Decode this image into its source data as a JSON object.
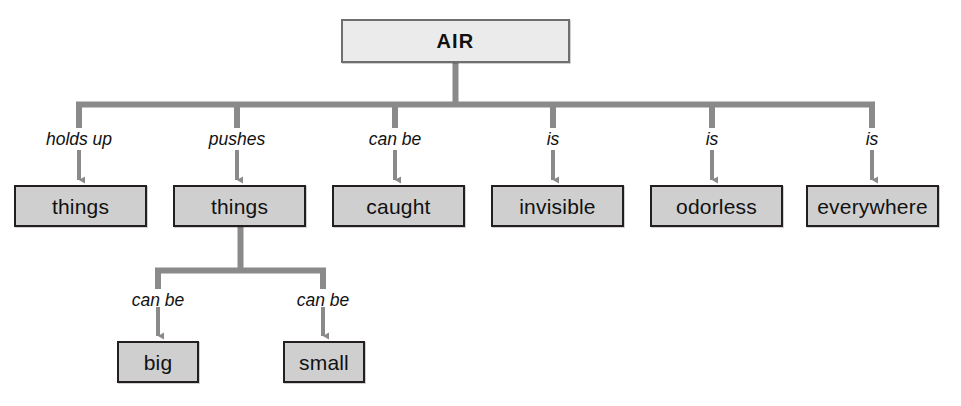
{
  "diagram": {
    "type": "tree-concept-map",
    "colors": {
      "background": "#ffffff",
      "node_fill": "#cfcfcf",
      "root_fill": "#ebebeb",
      "node_border": "#231f20",
      "root_border": "#6f6f6f",
      "connector": "#8a8a8a",
      "text": "#111111"
    },
    "root": {
      "label": "AIR"
    },
    "branches": [
      {
        "edge_label": "holds up",
        "node_label": "things"
      },
      {
        "edge_label": "pushes",
        "node_label": "things"
      },
      {
        "edge_label": "can be",
        "node_label": "caught"
      },
      {
        "edge_label": "is",
        "node_label": "invisible"
      },
      {
        "edge_label": "is",
        "node_label": "odorless"
      },
      {
        "edge_label": "is",
        "node_label": "everywhere"
      }
    ],
    "sub_branches": [
      {
        "parent": "things",
        "edge_label": "can be",
        "node_label": "big"
      },
      {
        "parent": "things",
        "edge_label": "can be",
        "node_label": "small"
      }
    ]
  }
}
